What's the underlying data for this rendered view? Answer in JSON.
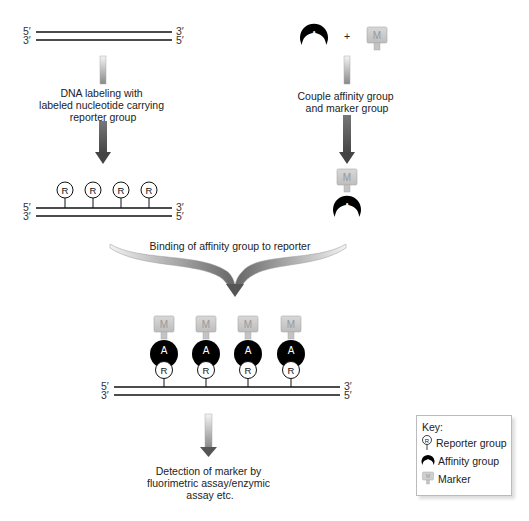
{
  "diagram": {
    "strand_ends": {
      "top_left": "5′",
      "top_right": "3′",
      "bottom_left": "3′",
      "bottom_right": "5′"
    },
    "steps": {
      "dna_labeling": [
        "DNA labeling with",
        "labeled nucleotide carrying",
        "reporter group"
      ],
      "couple": [
        "Couple affinity group",
        "and marker group"
      ],
      "binding": "Binding of affinity group to reporter",
      "detection": [
        "Detection of marker by",
        "fluorimetric assay/enzymic",
        "assay etc."
      ]
    },
    "symbols": {
      "reporter": "R",
      "affinity": "A",
      "marker": "M",
      "plus": "+"
    },
    "key": {
      "title": "Key:",
      "items": [
        {
          "symbol": "R",
          "label": "Reporter group"
        },
        {
          "symbol": "A",
          "label": "Affinity group"
        },
        {
          "symbol": "M",
          "label": "Marker"
        }
      ]
    },
    "colors": {
      "affinity": "#000000",
      "marker": "#c8c8c8",
      "arrow_dark": "#555555",
      "arrow_light": "#e8e8e8"
    }
  }
}
